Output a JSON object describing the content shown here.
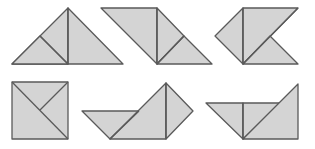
{
  "diagram": {
    "style": {
      "fill": "#d4d4d4",
      "stroke": "#5a5a5a",
      "stroke_width": 1.3,
      "background": "#ffffff"
    },
    "figures": [
      {
        "id": "figure-1",
        "description": "large triangle made of three smaller triangles",
        "pieces": [
          "12,64 68,8 68,64",
          "68,8 123,64 68,64",
          "12,64 40,36 68,64"
        ],
        "lines": [
          "68,8 68,64",
          "40,36 68,64"
        ]
      },
      {
        "id": "figure-2",
        "description": "parallelogram-like shape of three triangles",
        "pieces": [
          "101,8 157,8 157,64",
          "157,8 184,36 157,64",
          "157,64 184,36 212,64"
        ],
        "lines": [
          "157,8 157,64",
          "184,36 157,64"
        ]
      },
      {
        "id": "figure-3",
        "description": "arrow shape of three triangles",
        "pieces": [
          "215,36 243,8 243,64",
          "243,8 298,8 243,64",
          "243,64 270,36 298,64"
        ],
        "lines": [
          "243,8 243,64",
          "298,8 243,64"
        ]
      },
      {
        "id": "figure-4",
        "description": "square made of three triangles",
        "pieces": [
          "12,82 68,82 68,139 12,139"
        ],
        "lines": [
          "12,82 68,139",
          "68,82 40,110"
        ]
      },
      {
        "id": "figure-5",
        "description": "boat shape of three triangles",
        "pieces": [
          "82,111 139,111 110,139",
          "110,139 166,83 166,139",
          "166,83 193,111 166,139"
        ],
        "lines": [
          "166,83 166,139",
          "139,111 110,139"
        ]
      },
      {
        "id": "figure-6",
        "description": "trapezoid-like shape of three triangles",
        "pieces": [
          "206,103 243,103 243,139",
          "243,103 280,103 243,139",
          "243,139 298,84 298,139"
        ],
        "lines": [
          "243,103 243,139"
        ]
      }
    ]
  }
}
